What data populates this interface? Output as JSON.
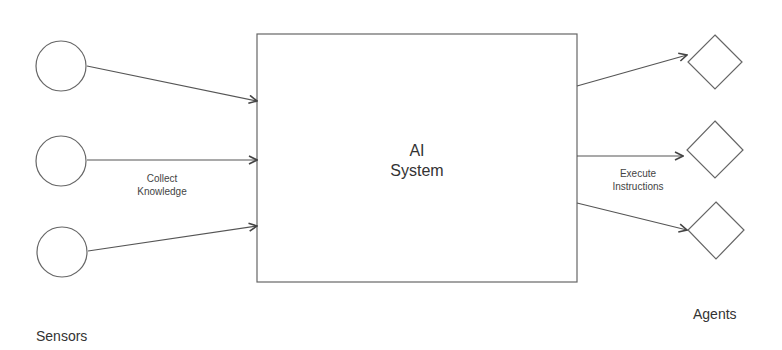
{
  "diagram": {
    "center_box": {
      "line1": "AI",
      "line2": "System"
    },
    "input_label": {
      "line1": "Collect",
      "line2": "Knowledge"
    },
    "output_label": {
      "line1": "Execute",
      "line2": "Instructions"
    },
    "sensors_label": "Sensors",
    "agents_label": "Agents",
    "sensors": [
      {
        "shape": "circle"
      },
      {
        "shape": "circle"
      },
      {
        "shape": "circle"
      }
    ],
    "agents": [
      {
        "shape": "diamond"
      },
      {
        "shape": "diamond"
      },
      {
        "shape": "diamond"
      }
    ],
    "stroke_color": "#555555"
  }
}
